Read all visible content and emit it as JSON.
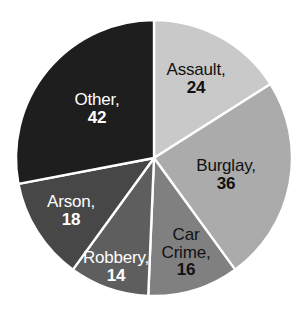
{
  "chart_data": {
    "type": "pie",
    "title": "",
    "subtitle": "",
    "xlabel": "",
    "ylabel": "",
    "legend_position": "none",
    "grid": false,
    "label_format": "name, value",
    "total": 150,
    "start_angle_deg": 0,
    "direction": "clockwise",
    "categories": [
      "Assault",
      "Burglay",
      "Car Crime",
      "Robbery",
      "Arson",
      "Other"
    ],
    "values": [
      24,
      36,
      16,
      14,
      18,
      42
    ],
    "slices": [
      {
        "name": "Assault",
        "label_line1": "Assault,",
        "label_line2": "",
        "value": "24",
        "value_number": 24,
        "percent": 16.0,
        "color": "#c9c9c9",
        "text_color": "#111111",
        "text_tone": "dark",
        "label_x": 196,
        "label_y": 79
      },
      {
        "name": "Burglay",
        "label_line1": "Burglay,",
        "label_line2": "",
        "value": "36",
        "value_number": 36,
        "percent": 24.0,
        "color": "#ababab",
        "text_color": "#111111",
        "text_tone": "dark",
        "label_x": 226,
        "label_y": 175
      },
      {
        "name": "Car Crime",
        "label_line1": "Car",
        "label_line2": "Crime,",
        "value": "16",
        "value_number": 16,
        "percent": 10.67,
        "color": "#808080",
        "text_color": "#111111",
        "text_tone": "dark",
        "label_y": 253,
        "label_x": 186
      },
      {
        "name": "Robbery",
        "label_line1": "Robbery,",
        "label_line2": "",
        "value": "14",
        "value_number": 14,
        "percent": 9.33,
        "color": "#5e5e5e",
        "text_color": "#ffffff",
        "text_tone": "light",
        "label_x": 116,
        "label_y": 267
      },
      {
        "name": "Arson",
        "label_line1": "Arson,",
        "label_line2": "",
        "value": "18",
        "value_number": 18,
        "percent": 12.0,
        "color": "#474747",
        "text_color": "#ffffff",
        "text_tone": "light",
        "label_x": 71,
        "label_y": 211
      },
      {
        "name": "Other",
        "label_line1": "Other,",
        "label_line2": "",
        "value": "42",
        "value_number": 42,
        "percent": 28.0,
        "color": "#1e1e1e",
        "text_color": "#ffffff",
        "text_tone": "light",
        "label_x": 97,
        "label_y": 109
      }
    ],
    "geometry": {
      "center_x": 154,
      "center_y": 158,
      "radius": 138,
      "separator_color": "#ffffff"
    },
    "background_color": "#ffffff"
  }
}
